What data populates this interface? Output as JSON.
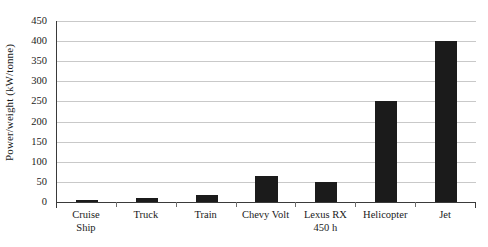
{
  "chart_data": {
    "type": "bar",
    "title": "",
    "xlabel": "",
    "ylabel": "Power/weight (kW/tonne)",
    "categories": [
      "Cruise Ship",
      "Truck",
      "Train",
      "Chevy Volt",
      "Lexus RX 450 h",
      "Helicopter",
      "Jet"
    ],
    "category_lines": [
      [
        "Cruise",
        "Ship"
      ],
      [
        "Truck",
        ""
      ],
      [
        "Train",
        ""
      ],
      [
        "Chevy Volt",
        ""
      ],
      [
        "Lexus RX",
        "450 h"
      ],
      [
        "Helicopter",
        ""
      ],
      [
        "Jet",
        ""
      ]
    ],
    "values": [
      4,
      10,
      18,
      65,
      50,
      250,
      400
    ],
    "ylim": [
      0,
      450
    ],
    "ytick_step": 50,
    "yticks": [
      0,
      50,
      100,
      150,
      200,
      250,
      300,
      350,
      400,
      450
    ],
    "ytick_labels": [
      "0",
      "50",
      "100",
      "150",
      "200",
      "250",
      "300",
      "350",
      "400",
      "450"
    ],
    "grid": true,
    "grid_axis": "y",
    "legend": false,
    "bar_color": "#1b1b1b",
    "gridline_color": "#c9c9c9",
    "axis_color": "#3a3a3a",
    "background_color": "#ffffff"
  }
}
